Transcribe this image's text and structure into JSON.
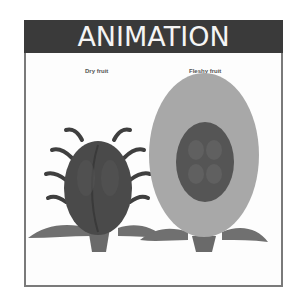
{
  "header": {
    "title": "ANIMATION"
  },
  "diagram": {
    "labels": {
      "dry": "Dry fruit",
      "fleshy": "Fleshy fruit"
    },
    "colors": {
      "header_bg": "#3a3a3a",
      "header_text": "#f4f4f4",
      "frame_border": "#7a7a7a",
      "dry_fruit_body": "#4a4a4a",
      "fleshy_outer": "#a8a8a8",
      "fleshy_inner": "#555555",
      "leaf": "#707070"
    }
  }
}
